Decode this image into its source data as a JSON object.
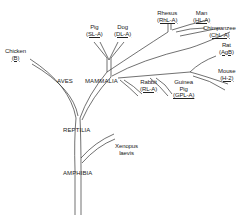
{
  "diagram": {
    "type": "phylogenetic-tree",
    "classes": [
      {
        "id": "aves",
        "label": "AVES"
      },
      {
        "id": "mammalia",
        "label": "MAMMALIA"
      },
      {
        "id": "reptilia",
        "label": "REPTILIA"
      },
      {
        "id": "amphibia",
        "label": "AMPHIBIA"
      }
    ],
    "species": [
      {
        "id": "chicken",
        "name": "Chicken",
        "code": "(B)"
      },
      {
        "id": "pig",
        "name": "Pig",
        "code": "(SL-A)"
      },
      {
        "id": "dog",
        "name": "Dog",
        "code": "(DL-A)"
      },
      {
        "id": "rhesus",
        "name": "Rhesus",
        "code": "(RhL-A)"
      },
      {
        "id": "man",
        "name": "Man",
        "code": "(HL-A)"
      },
      {
        "id": "chimpanzee",
        "name": "Chimpanzee",
        "code": "(ChL-A)"
      },
      {
        "id": "rat",
        "name": "Rat",
        "code": "(AgB)"
      },
      {
        "id": "mouse",
        "name": "Mouse",
        "code": "(H-2)"
      },
      {
        "id": "rabbit",
        "name": "Rabbit",
        "code": "(RL-A)"
      },
      {
        "id": "guinea_pig",
        "name": "Guinea Pig",
        "name_line1": "Guinea",
        "name_line2": "Pig",
        "code": "(GPL-A)"
      },
      {
        "id": "xenopus",
        "name": "Xenopus laevis",
        "name_line1": "Xenopus",
        "name_line2": "laevis",
        "code": ""
      }
    ]
  }
}
